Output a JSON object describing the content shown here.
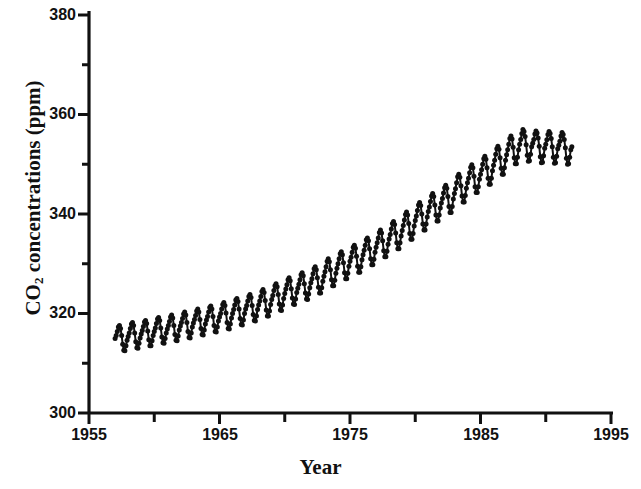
{
  "figure": {
    "background": "#ffffff",
    "ink_color": "#111111"
  },
  "axes": {
    "x_title": "Year",
    "y_title_main": "CO",
    "y_title_sub": "2",
    "y_title_rest": " concentrations (ppm)"
  },
  "chart_data": {
    "type": "line",
    "title": "",
    "subtitle": "",
    "xlabel": "Year",
    "ylabel": "CO2 concentrations (ppm)",
    "xlim": [
      1955,
      1995
    ],
    "ylim": [
      300,
      380
    ],
    "grid": false,
    "legend": "none",
    "marker": "filled-circle",
    "line_color": "#111111",
    "marker_color": "#111111",
    "x_major_ticks": [
      1955,
      1965,
      1975,
      1985,
      1995
    ],
    "x_major_tick_labels": [
      "1955",
      "1965",
      "1975",
      "1985",
      "1995"
    ],
    "x_minor_ticks": [
      1960,
      1970,
      1980,
      1990
    ],
    "y_major_ticks": [
      300,
      320,
      340,
      360,
      380
    ],
    "y_major_tick_labels": [
      "300",
      "320",
      "340",
      "360",
      "380"
    ],
    "y_minor_ticks": [
      310,
      330,
      350,
      370
    ],
    "series": [
      {
        "name": "Mauna Loa monthly mean CO2",
        "x_start": 1957.0,
        "x_end": 1992.0,
        "samples_per_year": 12,
        "x": [
          1957.0,
          1957.083,
          1957.167,
          1957.25,
          1957.333,
          1957.417,
          1957.5,
          1957.583,
          1957.667,
          1957.75,
          1957.833,
          1957.917,
          1958.0,
          1958.083,
          1958.167,
          1958.25,
          1958.333,
          1958.417,
          1958.5,
          1958.583,
          1958.667,
          1958.75,
          1958.833,
          1958.917,
          1959.0,
          1959.083,
          1959.167,
          1959.25,
          1959.333,
          1959.417,
          1959.5,
          1959.583,
          1959.667,
          1959.75,
          1959.833,
          1959.917,
          1960.0,
          1960.083,
          1960.167,
          1960.25,
          1960.333,
          1960.417,
          1960.5,
          1960.583,
          1960.667,
          1960.75,
          1960.833,
          1960.917,
          1961.0,
          1961.083,
          1961.167,
          1961.25,
          1961.333,
          1961.417,
          1961.5,
          1961.583,
          1961.667,
          1961.75,
          1961.833,
          1961.917,
          1962.0,
          1962.083,
          1962.167,
          1962.25,
          1962.333,
          1962.417,
          1962.5,
          1962.583,
          1962.667,
          1962.75,
          1962.833,
          1962.917,
          1963.0,
          1963.083,
          1963.167,
          1963.25,
          1963.333,
          1963.417,
          1963.5,
          1963.583,
          1963.667,
          1963.75,
          1963.833,
          1963.917,
          1964.0,
          1964.083,
          1964.167,
          1964.25,
          1964.333,
          1964.417,
          1964.5,
          1964.583,
          1964.667,
          1964.75,
          1964.833,
          1964.917,
          1965.0,
          1965.083,
          1965.167,
          1965.25,
          1965.333,
          1965.417,
          1965.5,
          1965.583,
          1965.667,
          1965.75,
          1965.833,
          1965.917,
          1966.0,
          1966.083,
          1966.167,
          1966.25,
          1966.333,
          1966.417,
          1966.5,
          1966.583,
          1966.667,
          1966.75,
          1966.833,
          1966.917,
          1967.0,
          1967.083,
          1967.167,
          1967.25,
          1967.333,
          1967.417,
          1967.5,
          1967.583,
          1967.667,
          1967.75,
          1967.833,
          1967.917,
          1968.0,
          1968.083,
          1968.167,
          1968.25,
          1968.333,
          1968.417,
          1968.5,
          1968.583,
          1968.667,
          1968.75,
          1968.833,
          1968.917,
          1969.0,
          1969.083,
          1969.167,
          1969.25,
          1969.333,
          1969.417,
          1969.5,
          1969.583,
          1969.667,
          1969.75,
          1969.833,
          1969.917,
          1970.0,
          1970.083,
          1970.167,
          1970.25,
          1970.333,
          1970.417,
          1970.5,
          1970.583,
          1970.667,
          1970.75,
          1970.833,
          1970.917,
          1971.0,
          1971.083,
          1971.167,
          1971.25,
          1971.333,
          1971.417,
          1971.5,
          1971.583,
          1971.667,
          1971.75,
          1971.833,
          1971.917,
          1972.0,
          1972.083,
          1972.167,
          1972.25,
          1972.333,
          1972.417,
          1972.5,
          1972.583,
          1972.667,
          1972.75,
          1972.833,
          1972.917,
          1973.0,
          1973.083,
          1973.167,
          1973.25,
          1973.333,
          1973.417,
          1973.5,
          1973.583,
          1973.667,
          1973.75,
          1973.833,
          1973.917,
          1974.0,
          1974.083,
          1974.167,
          1974.25,
          1974.333,
          1974.417,
          1974.5,
          1974.583,
          1974.667,
          1974.75,
          1974.833,
          1974.917,
          1975.0,
          1975.083,
          1975.167,
          1975.25,
          1975.333,
          1975.417,
          1975.5,
          1975.583,
          1975.667,
          1975.75,
          1975.833,
          1975.917,
          1976.0,
          1976.083,
          1976.167,
          1976.25,
          1976.333,
          1976.417,
          1976.5,
          1976.583,
          1976.667,
          1976.75,
          1976.833,
          1976.917,
          1977.0,
          1977.083,
          1977.167,
          1977.25,
          1977.333,
          1977.417,
          1977.5,
          1977.583,
          1977.667,
          1977.75,
          1977.833,
          1977.917,
          1978.0,
          1978.083,
          1978.167,
          1978.25,
          1978.333,
          1978.417,
          1978.5,
          1978.583,
          1978.667,
          1978.75,
          1978.833,
          1978.917,
          1979.0,
          1979.083,
          1979.167,
          1979.25,
          1979.333,
          1979.417,
          1979.5,
          1979.583,
          1979.667,
          1979.75,
          1979.833,
          1979.917,
          1980.0,
          1980.083,
          1980.167,
          1980.25,
          1980.333,
          1980.417,
          1980.5,
          1980.583,
          1980.667,
          1980.75,
          1980.833,
          1980.917,
          1981.0,
          1981.083,
          1981.167,
          1981.25,
          1981.333,
          1981.417,
          1981.5,
          1981.583,
          1981.667,
          1981.75,
          1981.833,
          1981.917,
          1982.0,
          1982.083,
          1982.167,
          1982.25,
          1982.333,
          1982.417,
          1982.5,
          1982.583,
          1982.667,
          1982.75,
          1982.833,
          1982.917,
          1983.0,
          1983.083,
          1983.167,
          1983.25,
          1983.333,
          1983.417,
          1983.5,
          1983.583,
          1983.667,
          1983.75,
          1983.833,
          1983.917,
          1984.0,
          1984.083,
          1984.167,
          1984.25,
          1984.333,
          1984.417,
          1984.5,
          1984.583,
          1984.667,
          1984.75,
          1984.833,
          1984.917,
          1985.0,
          1985.083,
          1985.167,
          1985.25,
          1985.333,
          1985.417,
          1985.5,
          1985.583,
          1985.667,
          1985.75,
          1985.833,
          1985.917,
          1986.0,
          1986.083,
          1986.167,
          1986.25,
          1986.333,
          1986.417,
          1986.5,
          1986.583,
          1986.667,
          1986.75,
          1986.833,
          1986.917,
          1987.0,
          1987.083,
          1987.167,
          1987.25,
          1987.333,
          1987.417,
          1987.5,
          1987.583,
          1987.667,
          1987.75,
          1987.833,
          1987.917,
          1988.0,
          1988.083,
          1988.167,
          1988.25,
          1988.333,
          1988.417,
          1988.5,
          1988.583,
          1988.667,
          1988.75,
          1988.833,
          1988.917,
          1989.0,
          1989.083,
          1989.167,
          1989.25,
          1989.333,
          1989.417,
          1989.5,
          1989.583,
          1989.667,
          1989.75,
          1989.833,
          1989.917,
          1990.0,
          1990.083,
          1990.167,
          1990.25,
          1990.333,
          1990.417,
          1990.5,
          1990.583,
          1990.667,
          1990.75,
          1990.833,
          1990.917,
          1991.0,
          1991.083,
          1991.167,
          1991.25,
          1991.333,
          1991.417,
          1991.5,
          1991.583,
          1991.667,
          1991.75,
          1991.833,
          1991.917,
          1992.0
        ],
        "values": [
          315.0,
          315.6,
          316.4,
          317.3,
          317.6,
          317.0,
          315.6,
          313.8,
          312.6,
          312.5,
          313.5,
          314.6,
          315.4,
          316.1,
          317.0,
          317.9,
          318.2,
          317.6,
          316.1,
          314.3,
          313.1,
          313.0,
          314.0,
          315.1,
          315.9,
          316.6,
          317.4,
          318.3,
          318.6,
          318.0,
          316.5,
          314.7,
          313.5,
          313.5,
          314.5,
          315.6,
          316.4,
          317.1,
          318.0,
          318.9,
          319.2,
          318.6,
          317.1,
          315.3,
          314.1,
          314.0,
          315.0,
          316.1,
          316.9,
          317.6,
          318.4,
          319.3,
          319.7,
          319.1,
          317.6,
          315.8,
          314.6,
          314.5,
          315.5,
          316.7,
          317.5,
          318.2,
          319.0,
          319.9,
          320.3,
          319.7,
          318.2,
          316.4,
          315.2,
          315.1,
          316.1,
          317.3,
          318.1,
          318.8,
          319.6,
          320.5,
          320.9,
          320.3,
          318.8,
          317.0,
          315.8,
          315.7,
          316.7,
          317.9,
          318.7,
          319.4,
          320.3,
          321.2,
          321.5,
          320.9,
          319.4,
          317.6,
          316.4,
          316.3,
          317.3,
          318.5,
          319.3,
          320.0,
          320.9,
          321.8,
          322.2,
          321.6,
          320.1,
          318.2,
          317.0,
          316.9,
          317.9,
          319.1,
          320.0,
          320.8,
          321.7,
          322.7,
          323.0,
          322.4,
          320.9,
          319.0,
          317.8,
          317.7,
          318.7,
          320.0,
          320.9,
          321.6,
          322.5,
          323.4,
          323.8,
          323.2,
          321.6,
          319.8,
          318.6,
          318.5,
          319.5,
          320.8,
          321.7,
          322.5,
          323.4,
          324.4,
          324.8,
          324.2,
          322.6,
          320.7,
          319.5,
          319.5,
          320.5,
          321.8,
          322.8,
          323.6,
          324.6,
          325.6,
          326.0,
          325.4,
          323.8,
          321.9,
          320.7,
          320.6,
          321.7,
          323.0,
          324.0,
          324.9,
          325.8,
          326.8,
          327.2,
          326.6,
          325.0,
          323.1,
          321.9,
          321.8,
          322.9,
          324.2,
          325.1,
          325.9,
          326.8,
          327.8,
          328.2,
          327.6,
          326.0,
          324.1,
          322.9,
          322.8,
          323.9,
          325.2,
          326.2,
          327.0,
          328.0,
          329.0,
          329.4,
          328.8,
          327.2,
          325.3,
          324.1,
          324.1,
          325.2,
          326.5,
          327.5,
          328.4,
          329.4,
          330.5,
          331.0,
          330.4,
          328.8,
          326.8,
          325.6,
          325.6,
          326.7,
          328.1,
          329.1,
          330.0,
          331.0,
          332.0,
          332.4,
          331.8,
          330.2,
          328.2,
          327.0,
          327.0,
          328.1,
          329.5,
          330.5,
          331.3,
          332.3,
          333.3,
          333.7,
          333.1,
          331.5,
          329.5,
          328.3,
          328.3,
          329.4,
          330.8,
          331.8,
          332.7,
          333.7,
          334.8,
          335.2,
          334.6,
          333.0,
          331.0,
          329.8,
          329.8,
          330.9,
          332.3,
          333.3,
          334.2,
          335.2,
          336.3,
          336.8,
          336.2,
          334.6,
          332.6,
          331.4,
          331.4,
          332.5,
          333.9,
          335.0,
          335.9,
          337.0,
          338.1,
          338.5,
          337.9,
          336.2,
          334.2,
          333.0,
          333.0,
          334.2,
          335.6,
          336.7,
          337.7,
          338.8,
          339.9,
          340.4,
          339.8,
          338.1,
          336.1,
          334.9,
          334.9,
          336.1,
          337.6,
          338.7,
          339.6,
          340.7,
          341.8,
          342.3,
          341.7,
          340.0,
          338.0,
          336.8,
          336.8,
          338.0,
          339.4,
          340.5,
          341.4,
          342.5,
          343.6,
          344.1,
          343.5,
          341.8,
          339.8,
          338.6,
          338.6,
          339.8,
          341.2,
          342.2,
          343.1,
          344.2,
          345.3,
          345.8,
          345.2,
          343.5,
          341.5,
          340.3,
          340.3,
          341.5,
          343.0,
          344.1,
          345.1,
          346.3,
          347.5,
          348.0,
          347.4,
          345.7,
          343.6,
          342.4,
          342.4,
          343.7,
          345.2,
          346.3,
          347.2,
          348.3,
          349.4,
          349.9,
          349.3,
          347.6,
          345.5,
          344.3,
          344.3,
          345.5,
          347.0,
          348.0,
          348.9,
          350.0,
          351.1,
          351.6,
          351.0,
          349.3,
          347.2,
          346.0,
          346.0,
          347.2,
          348.7,
          349.8,
          350.8,
          352.0,
          353.1,
          353.6,
          353.0,
          351.3,
          349.2,
          348.0,
          348.0,
          349.3,
          350.8,
          351.9,
          352.9,
          354.0,
          355.2,
          355.7,
          355.1,
          353.4,
          351.3,
          350.1,
          350.1,
          351.4,
          352.9,
          354.0,
          355.0,
          356.2,
          357.0,
          356.6,
          355.6,
          353.9,
          351.8,
          350.6,
          350.7,
          352.0,
          353.5,
          354.2,
          355.0,
          356.1,
          356.7,
          356.3,
          355.3,
          353.6,
          351.5,
          350.3,
          350.4,
          351.7,
          353.2,
          354.0,
          354.9,
          356.0,
          356.6,
          356.2,
          355.2,
          353.5,
          351.4,
          350.2,
          350.3,
          351.6,
          353.1,
          353.8,
          354.6,
          355.7,
          356.4,
          356.0,
          355.0,
          353.3,
          351.2,
          350.0,
          350.1,
          351.4,
          352.9,
          353.5
        ]
      }
    ],
    "annotations": []
  }
}
